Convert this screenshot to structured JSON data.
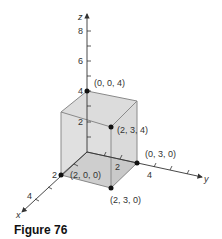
{
  "figure": {
    "caption": "Figure 76",
    "axes": {
      "x": {
        "label": "x",
        "ticks": [
          "2",
          "4"
        ]
      },
      "y": {
        "label": "y",
        "ticks": [
          "2",
          "4"
        ]
      },
      "z": {
        "label": "z",
        "ticks": [
          "2",
          "4",
          "6",
          "8"
        ]
      }
    },
    "points": [
      {
        "label": "(0, 0, 4)"
      },
      {
        "label": "(2, 3, 4)"
      },
      {
        "label": "(2, 0, 0)"
      },
      {
        "label": "(0, 3, 0)"
      },
      {
        "label": "(2, 3, 0)"
      }
    ],
    "colors": {
      "box_face": "#d9d9d9",
      "box_bottom": "#b5b5b5",
      "box_edge": "#8a8a8a",
      "axis": "#333333",
      "point": "#111111"
    }
  }
}
